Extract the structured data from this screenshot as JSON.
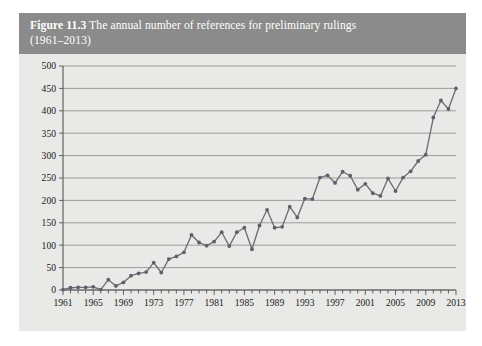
{
  "figure": {
    "number_label": "Figure 11.3",
    "caption_line1": "The annual number of references for preliminary rulings",
    "caption_line2": "(1961–2013)",
    "header_bg": "#8b8b8b",
    "header_fg": "#ffffff",
    "panel_bg": "#e9e9e7"
  },
  "chart_data": {
    "type": "line",
    "title": "Figure 11.3 The annual number of references for preliminary rulings (1961–2013)",
    "xlabel": "",
    "ylabel": "",
    "xlim": [
      1961,
      2013
    ],
    "ylim": [
      0,
      500
    ],
    "grid": true,
    "legend": false,
    "series_color": "#6e6e78",
    "marker": "circle",
    "y_ticks": [
      0,
      50,
      100,
      150,
      200,
      250,
      300,
      350,
      400,
      450,
      500
    ],
    "y_tick_labels": [
      "0",
      "50",
      "100",
      "150",
      "200",
      "250",
      "300",
      "350",
      "400",
      "450",
      "500"
    ],
    "x_tick_labels": [
      "1961",
      "1965",
      "1969",
      "1973",
      "1977",
      "1981",
      "1985",
      "1989",
      "1993",
      "1997",
      "2001",
      "2005",
      "2009",
      "2013"
    ],
    "x_tick_label_years": [
      1961,
      1965,
      1969,
      1973,
      1977,
      1981,
      1985,
      1989,
      1993,
      1997,
      2001,
      2005,
      2009,
      2013
    ],
    "x_minor_tick_interval": 1,
    "x": [
      1961,
      1962,
      1963,
      1964,
      1965,
      1966,
      1967,
      1968,
      1969,
      1970,
      1971,
      1972,
      1973,
      1974,
      1975,
      1976,
      1977,
      1978,
      1979,
      1980,
      1981,
      1982,
      1983,
      1984,
      1985,
      1986,
      1987,
      1988,
      1989,
      1990,
      1991,
      1992,
      1993,
      1994,
      1995,
      1996,
      1997,
      1998,
      1999,
      2000,
      2001,
      2002,
      2003,
      2004,
      2005,
      2006,
      2007,
      2008,
      2009,
      2010,
      2011,
      2012,
      2013
    ],
    "values": [
      1,
      5,
      6,
      6,
      7,
      1,
      23,
      9,
      17,
      32,
      37,
      40,
      61,
      39,
      69,
      75,
      84,
      123,
      106,
      99,
      108,
      129,
      98,
      129,
      139,
      91,
      144,
      179,
      139,
      141,
      186,
      162,
      204,
      203,
      251,
      256,
      239,
      264,
      255,
      224,
      237,
      216,
      210,
      249,
      221,
      251,
      265,
      288,
      302,
      385,
      423,
      404,
      450
    ],
    "annual_data_points": [
      {
        "year": 1961,
        "value": 1
      },
      {
        "year": 1962,
        "value": 5
      },
      {
        "year": 1963,
        "value": 6
      },
      {
        "year": 1964,
        "value": 6
      },
      {
        "year": 1965,
        "value": 7
      },
      {
        "year": 1966,
        "value": 1
      },
      {
        "year": 1967,
        "value": 23
      },
      {
        "year": 1968,
        "value": 9
      },
      {
        "year": 1969,
        "value": 17
      },
      {
        "year": 1970,
        "value": 32
      },
      {
        "year": 1971,
        "value": 37
      },
      {
        "year": 1972,
        "value": 40
      },
      {
        "year": 1973,
        "value": 61
      },
      {
        "year": 1974,
        "value": 39
      },
      {
        "year": 1975,
        "value": 69
      },
      {
        "year": 1976,
        "value": 75
      },
      {
        "year": 1977,
        "value": 84
      },
      {
        "year": 1978,
        "value": 123
      },
      {
        "year": 1979,
        "value": 106
      },
      {
        "year": 1980,
        "value": 99
      },
      {
        "year": 1981,
        "value": 108
      },
      {
        "year": 1982,
        "value": 129
      },
      {
        "year": 1983,
        "value": 98
      },
      {
        "year": 1984,
        "value": 129
      },
      {
        "year": 1985,
        "value": 139
      },
      {
        "year": 1986,
        "value": 91
      },
      {
        "year": 1987,
        "value": 144
      },
      {
        "year": 1988,
        "value": 179
      },
      {
        "year": 1989,
        "value": 139
      },
      {
        "year": 1990,
        "value": 141
      },
      {
        "year": 1991,
        "value": 186
      },
      {
        "year": 1992,
        "value": 162
      },
      {
        "year": 1993,
        "value": 204
      },
      {
        "year": 1994,
        "value": 203
      },
      {
        "year": 1995,
        "value": 251
      },
      {
        "year": 1996,
        "value": 256
      },
      {
        "year": 1997,
        "value": 239
      },
      {
        "year": 1998,
        "value": 264
      },
      {
        "year": 1999,
        "value": 255
      },
      {
        "year": 2000,
        "value": 224
      },
      {
        "year": 2001,
        "value": 237
      },
      {
        "year": 2002,
        "value": 216
      },
      {
        "year": 2003,
        "value": 210
      },
      {
        "year": 2004,
        "value": 249
      },
      {
        "year": 2005,
        "value": 221
      },
      {
        "year": 2006,
        "value": 251
      },
      {
        "year": 2007,
        "value": 265
      },
      {
        "year": 2008,
        "value": 288
      },
      {
        "year": 2009,
        "value": 302
      },
      {
        "year": 2010,
        "value": 385
      },
      {
        "year": 2011,
        "value": 423
      },
      {
        "year": 2012,
        "value": 404
      },
      {
        "year": 2013,
        "value": 450
      }
    ]
  }
}
